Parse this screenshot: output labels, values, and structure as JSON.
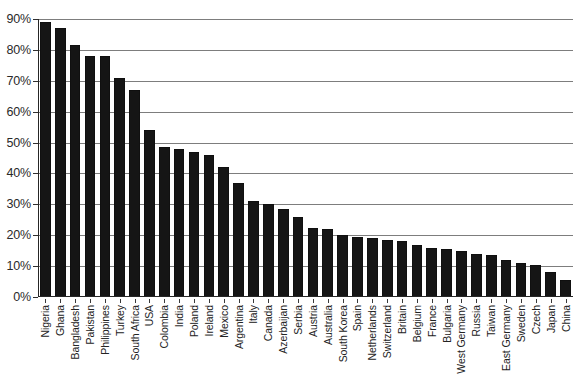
{
  "chart_data": {
    "type": "bar",
    "title": "",
    "subtitle": "",
    "xlabel": "",
    "ylabel": "",
    "ylim": [
      0,
      90
    ],
    "ytick_labels": [
      "90%",
      "80%",
      "70%",
      "60%",
      "50%",
      "40%",
      "30%",
      "20%",
      "10%",
      "0%"
    ],
    "ytick_values": [
      90,
      80,
      70,
      60,
      50,
      40,
      30,
      20,
      10,
      0
    ],
    "grid": true,
    "grid_axis": "y",
    "legend": "none",
    "bar_color": "#151515",
    "grid_color": "#7d7d7d",
    "axis_color": "#262626",
    "background": "#ffffff",
    "orientation": "vertical",
    "sorted": "descending",
    "categories": [
      "Nigeria",
      "Ghana",
      "Bangladesh",
      "Pakistan",
      "Philippines",
      "Turkey",
      "South Africa",
      "USA",
      "Colombia",
      "India",
      "Poland",
      "Ireland",
      "Mexico",
      "Argentina",
      "Italy",
      "Canada",
      "Azerbaijan",
      "Serbia",
      "Austria",
      "Australia",
      "South Korea",
      "Spain",
      "Netherlands",
      "Switzerland",
      "Britain",
      "Belgium",
      "France",
      "Bulgaria",
      "West Germany",
      "Russia",
      "Taiwan",
      "East Germany",
      "Sweden",
      "Czech",
      "Japan",
      "China"
    ],
    "values": [
      89,
      87,
      81.5,
      78,
      78,
      71,
      67,
      54,
      48.5,
      48,
      47,
      46,
      42,
      37,
      31,
      30,
      28.5,
      26,
      22.5,
      22,
      20,
      19.5,
      19,
      18.5,
      18,
      17,
      16,
      15.5,
      15,
      14,
      13.5,
      12,
      11,
      10.5,
      8,
      5.5
    ]
  }
}
